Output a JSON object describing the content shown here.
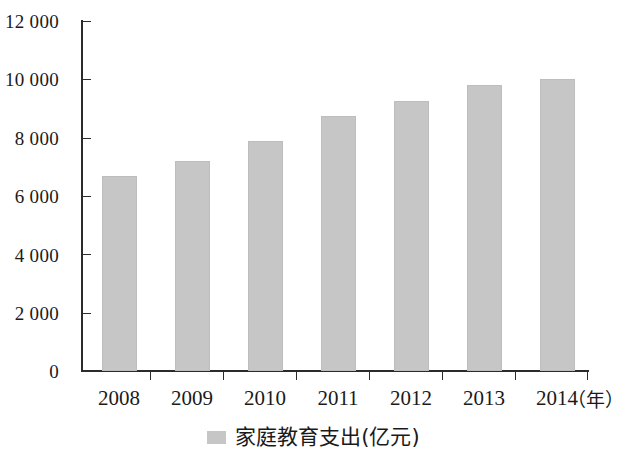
{
  "chart_data": {
    "type": "bar",
    "title": "",
    "xlabel": "年",
    "ylabel": "",
    "x_unit_label": "（年）",
    "categories": [
      "2008",
      "2009",
      "2010",
      "2011",
      "2012",
      "2013",
      "2014"
    ],
    "values": [
      6700,
      7200,
      7900,
      8750,
      9250,
      9800,
      10000
    ],
    "series": [
      {
        "name": "家庭教育支出(亿元)",
        "values": [
          6700,
          7200,
          7900,
          8750,
          9250,
          9800,
          10000
        ],
        "color": "#c6c6c6"
      }
    ],
    "ylim": [
      0,
      12000
    ],
    "y_ticks": [
      0,
      2000,
      4000,
      6000,
      8000,
      10000,
      12000
    ],
    "y_tick_labels": [
      "0",
      "2 000",
      "4 000",
      "6 000",
      "8 000",
      "10 000",
      "12 000"
    ],
    "grid": false,
    "legend_position": "bottom-center",
    "legend": [
      {
        "label": "家庭教育支出(亿元)",
        "color": "#c6c6c6"
      }
    ],
    "colors": {
      "bar_fill": "#c6c6c6",
      "bar_stroke": "#bdbdbd",
      "axis": "#2b2b2b",
      "text": "#1a1a1a",
      "background": "#ffffff"
    }
  }
}
